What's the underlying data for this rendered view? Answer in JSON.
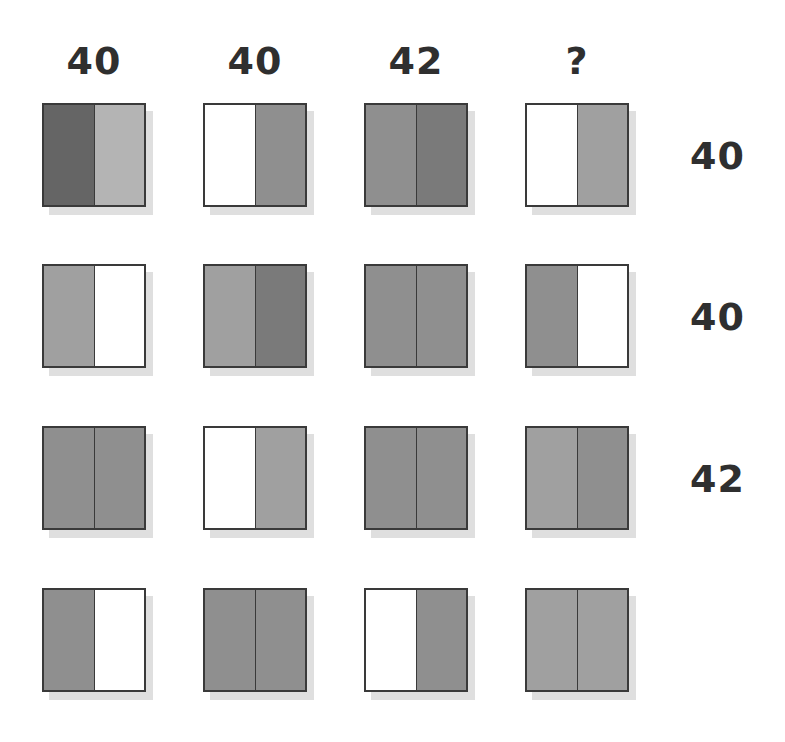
{
  "puzzle": {
    "type": "matrix-reasoning-grid",
    "rows": 4,
    "columns": 4,
    "column_headers": [
      "40",
      "40",
      "42",
      "?"
    ],
    "row_labels": [
      "40",
      "40",
      "42",
      ""
    ],
    "palette": {
      "white": "#ffffff",
      "light_gray": "#b4b4b4",
      "mid_light_gray": "#a0a0a0",
      "mid_gray": "#8f8f8f",
      "mid_dark_gray": "#7a7a7a",
      "dark_gray": "#656565",
      "border": "#3a3a3a",
      "shadow": "#d9d9d9",
      "text": "#2f2f2f",
      "background": "#ffffff"
    },
    "cells": [
      [
        {
          "name": "cell-r1c1",
          "left": "#656565",
          "right": "#b4b4b4"
        },
        {
          "name": "cell-r1c2",
          "left": "#ffffff",
          "right": "#8f8f8f"
        },
        {
          "name": "cell-r1c3",
          "left": "#8f8f8f",
          "right": "#7a7a7a"
        },
        {
          "name": "cell-r1c4",
          "left": "#ffffff",
          "right": "#a0a0a0"
        }
      ],
      [
        {
          "name": "cell-r2c1",
          "left": "#a0a0a0",
          "right": "#ffffff"
        },
        {
          "name": "cell-r2c2",
          "left": "#a0a0a0",
          "right": "#7a7a7a"
        },
        {
          "name": "cell-r2c3",
          "left": "#8f8f8f",
          "right": "#8f8f8f"
        },
        {
          "name": "cell-r2c4",
          "left": "#8f8f8f",
          "right": "#ffffff"
        }
      ],
      [
        {
          "name": "cell-r3c1",
          "left": "#8f8f8f",
          "right": "#8f8f8f"
        },
        {
          "name": "cell-r3c2",
          "left": "#ffffff",
          "right": "#a0a0a0"
        },
        {
          "name": "cell-r3c3",
          "left": "#8f8f8f",
          "right": "#8f8f8f"
        },
        {
          "name": "cell-r3c4",
          "left": "#a0a0a0",
          "right": "#8f8f8f"
        }
      ],
      [
        {
          "name": "cell-r4c1",
          "left": "#8f8f8f",
          "right": "#ffffff"
        },
        {
          "name": "cell-r4c2",
          "left": "#8f8f8f",
          "right": "#8f8f8f"
        },
        {
          "name": "cell-r4c3",
          "left": "#ffffff",
          "right": "#8f8f8f"
        },
        {
          "name": "cell-r4c4",
          "left": "#a0a0a0",
          "right": "#a0a0a0"
        }
      ]
    ],
    "layout": {
      "column_x": [
        42,
        203,
        364,
        525
      ],
      "row_y": [
        103,
        264,
        426,
        588
      ],
      "header_y": 42,
      "cell_size": 104
    }
  }
}
